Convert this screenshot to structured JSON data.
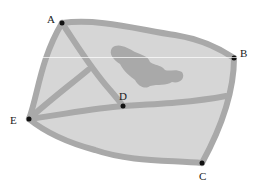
{
  "diagram": {
    "colors": {
      "fill": "#d6d6d6",
      "path": "#a9a9a9",
      "island": "#a9a9a9",
      "dot": "#111111",
      "label": "#1a1a1a"
    },
    "nodes": [
      {
        "id": "A",
        "label": "A",
        "x": 62,
        "y": 23
      },
      {
        "id": "B",
        "label": "B",
        "x": 234,
        "y": 58
      },
      {
        "id": "C",
        "label": "C",
        "x": 202,
        "y": 163
      },
      {
        "id": "D",
        "label": "D",
        "x": 123,
        "y": 106
      },
      {
        "id": "E",
        "label": "E",
        "x": 29,
        "y": 119
      }
    ],
    "edges": [
      [
        "A",
        "B"
      ],
      [
        "B",
        "C"
      ],
      [
        "C",
        "E"
      ],
      [
        "E",
        "A"
      ],
      [
        "A",
        "D"
      ],
      [
        "E",
        "D"
      ],
      [
        "D",
        "B"
      ]
    ]
  }
}
